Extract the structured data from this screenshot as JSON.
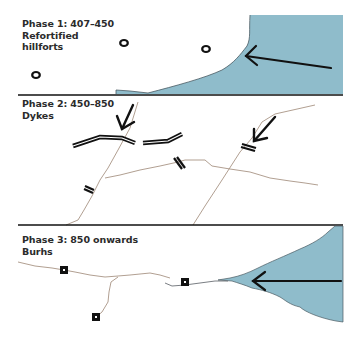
{
  "colors": {
    "water": "#8fbccb",
    "coast_edge": "#4a5a62",
    "divider": "#111111",
    "road": "#a89484",
    "arrow": "#111111",
    "dyke": "#111111"
  },
  "panels": [
    {
      "id": "phase-1",
      "title": "Phase 1: 407–450",
      "subtitle_lines": [
        "Refortified",
        "hillforts"
      ],
      "features": {
        "hillforts": [
          {
            "x": 124,
            "y": 43
          },
          {
            "x": 206,
            "y": 49
          },
          {
            "x": 36,
            "y": 75
          }
        ],
        "invasion_arrow": {
          "from": [
            330,
            68
          ],
          "to": [
            245,
            55
          ]
        }
      }
    },
    {
      "id": "phase-2",
      "title": "Phase 2: 450–850",
      "subtitle_lines": [
        "Dykes"
      ],
      "features": {
        "arrows": [
          {
            "from": [
              135,
              105
            ],
            "to": [
              120,
              128
            ]
          },
          {
            "from": [
              272,
              117
            ],
            "to": [
              252,
              141
            ]
          }
        ]
      }
    },
    {
      "id": "phase-3",
      "title": "Phase 3: 850 onwards",
      "subtitle_lines": [
        "Burhs"
      ],
      "features": {
        "burhs": [
          {
            "x": 64,
            "y": 270
          },
          {
            "x": 185,
            "y": 282
          },
          {
            "x": 96,
            "y": 317
          }
        ],
        "invasion_arrow": {
          "from": [
            341,
            281
          ],
          "to": [
            252,
            281
          ]
        }
      }
    }
  ]
}
